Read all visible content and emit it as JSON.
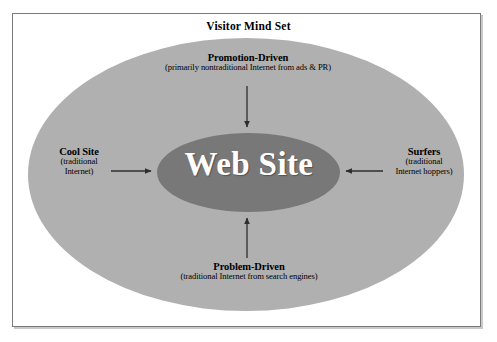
{
  "figure": {
    "title": "Visitor Mind Set",
    "center_label": "Web Site",
    "colors": {
      "outer_ellipse": "#b0b0b0",
      "inner_ellipse": "#787878",
      "border": "#7b7b7b",
      "text": "#000000",
      "center_text": "#ffffff",
      "arrow": "#3a3a3a",
      "background": "#ffffff"
    },
    "nodes": [
      {
        "id": "promotion-driven",
        "heading": "Promotion-Driven",
        "subtitle": "(primarily nontraditional Internet from ads & PR)",
        "position": "top",
        "arrow_direction": "down"
      },
      {
        "id": "cool-site",
        "heading": "Cool Site",
        "subtitle_line1": "(traditional",
        "subtitle_line2": "Internet)",
        "position": "left",
        "arrow_direction": "right"
      },
      {
        "id": "surfers",
        "heading": "Surfers",
        "subtitle_line1": "(traditional",
        "subtitle_line2": "Internet hoppers)",
        "position": "right",
        "arrow_direction": "left"
      },
      {
        "id": "problem-driven",
        "heading": "Problem-Driven",
        "subtitle": "(traditional Internet from search engines)",
        "position": "bottom",
        "arrow_direction": "up"
      }
    ]
  }
}
